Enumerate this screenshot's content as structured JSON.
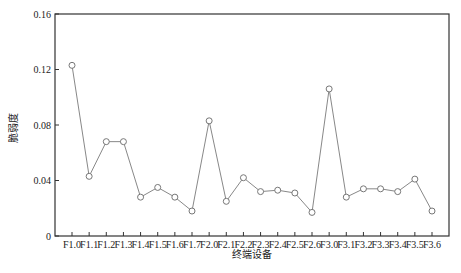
{
  "chart_data": {
    "type": "line",
    "title": "",
    "xlabel": "终端设备",
    "ylabel": "脆弱度",
    "caption": "",
    "categories": [
      "F1.0",
      "F1.1",
      "F1.2",
      "F1.3",
      "F1.4",
      "F1.5",
      "F1.6",
      "F1.7",
      "F2.0",
      "F2.1",
      "F2.2",
      "F2.3",
      "F2.4",
      "F2.5",
      "F2.6",
      "F3.0",
      "F3.1",
      "F3.2",
      "F3.3",
      "F3.4",
      "F3.5",
      "F3.6"
    ],
    "series": [
      {
        "name": "脆弱度",
        "values": [
          0.123,
          0.043,
          0.068,
          0.068,
          0.028,
          0.035,
          0.028,
          0.018,
          0.083,
          0.025,
          0.042,
          0.032,
          0.033,
          0.031,
          0.017,
          0.106,
          0.028,
          0.034,
          0.034,
          0.032,
          0.041,
          0.018
        ],
        "color": "#888888",
        "marker": "open-circle"
      }
    ],
    "ylim": [
      0,
      0.16
    ],
    "yticks": [
      0,
      0.04,
      0.08,
      0.12,
      0.16
    ],
    "ytick_labels": [
      "0",
      "0.04",
      "0.08",
      "0.12",
      "0.16"
    ],
    "grid": false,
    "legend": null
  }
}
